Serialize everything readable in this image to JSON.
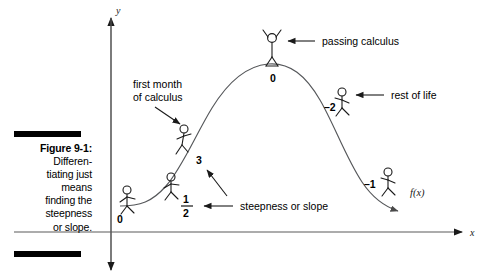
{
  "figure": {
    "caption_label": "Figure 9-1:",
    "caption_body": "Differen-\ntiating just\nmeans\nfinding the\nsteepness\nor slope.",
    "caption_lines": [
      "Figure 9-1:",
      "Differen-",
      "tiating just",
      "means",
      "finding the",
      "steepness",
      "or slope."
    ],
    "background_color": "#ffffff",
    "ink_color": "#000000",
    "curve_color": "#555555"
  },
  "axes": {
    "y_label": "y",
    "x_label": "x",
    "y_axis_name": "vertical-axis",
    "x_axis_name": "horizontal-axis"
  },
  "curve": {
    "function_label": "f(x)",
    "shape": "sigmoid-hump"
  },
  "slope_labels": [
    {
      "id": "slope-0-start",
      "text": "0",
      "x": 120,
      "y": 219
    },
    {
      "id": "slope-half",
      "text": "1",
      "sub": "2",
      "x": 186,
      "y": 206,
      "fraction": true
    },
    {
      "id": "slope-3",
      "text": "3",
      "x": 199,
      "y": 160
    },
    {
      "id": "slope-0-peak",
      "text": "0",
      "x": 274,
      "y": 78
    },
    {
      "id": "slope-minus-2",
      "text": "–2",
      "x": 330,
      "y": 107
    },
    {
      "id": "slope-minus-1",
      "text": "–1",
      "x": 370,
      "y": 184
    }
  ],
  "annotations": [
    {
      "id": "annotation-first-month",
      "line1": "first month",
      "line2": "of calculus"
    },
    {
      "id": "annotation-passing-calculus",
      "text": "passing calculus"
    },
    {
      "id": "annotation-rest-of-life",
      "text": "rest of life"
    },
    {
      "id": "annotation-steepness",
      "text": "steepness or slope"
    }
  ],
  "stick_figures": [
    {
      "id": "figure-walker-1",
      "pose": "walking",
      "location": "flat-start"
    },
    {
      "id": "figure-walker-2",
      "pose": "walking",
      "location": "early-rise"
    },
    {
      "id": "figure-climber",
      "pose": "climbing",
      "location": "steep-rise"
    },
    {
      "id": "figure-celebrating",
      "pose": "arms-raised",
      "location": "peak"
    },
    {
      "id": "figure-descender-1",
      "pose": "descending",
      "location": "steep-fall"
    },
    {
      "id": "figure-descender-2",
      "pose": "descending",
      "location": "late-fall"
    }
  ]
}
